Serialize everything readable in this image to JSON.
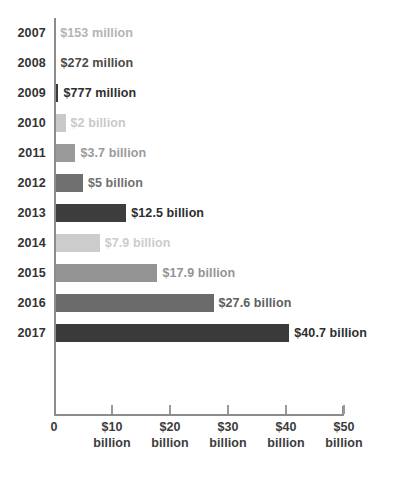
{
  "chart_data": {
    "type": "bar",
    "orientation": "horizontal",
    "title": "",
    "subtitle": "",
    "xlabel": "",
    "ylabel": "",
    "xlim": [
      0,
      50
    ],
    "grid": false,
    "legend": null,
    "categories": [
      "2007",
      "2008",
      "2009",
      "2010",
      "2011",
      "2012",
      "2013",
      "2014",
      "2015",
      "2016",
      "2017"
    ],
    "values": [
      0.153,
      0.272,
      0.777,
      2,
      3.7,
      5,
      12.5,
      7.9,
      17.9,
      27.6,
      40.7
    ],
    "unit": "USD billions",
    "data_labels": [
      "$153  million",
      "$272  million",
      "$777 million",
      "$2 billion",
      "$3.7 billion",
      "$5 billion",
      "$12.5 billion",
      "$7.9 billion",
      "$17.9 billion",
      "$27.6 billion",
      "$40.7 billion"
    ],
    "bar_colors": [
      "#b4b4b4",
      "#4a4a4a",
      "#3a3a3a",
      "#c9c9c9",
      "#9a9a9a",
      "#707070",
      "#3d3d3d",
      "#cccccc",
      "#949494",
      "#6b6b6b",
      "#3a3a3a"
    ],
    "label_colors": [
      "#b4b4b4",
      "#4a4a4a",
      "#2e2e2e",
      "#c9c9c9",
      "#9a9a9a",
      "#707070",
      "#2e2e2e",
      "#cccccc",
      "#949494",
      "#5e5e5e",
      "#2e2e2e"
    ],
    "xticks": [
      {
        "value": 0,
        "label": "0",
        "unit": ""
      },
      {
        "value": 10,
        "label": "$10",
        "unit": "billion"
      },
      {
        "value": 20,
        "label": "$20",
        "unit": "billion"
      },
      {
        "value": 30,
        "label": "$30",
        "unit": "billion"
      },
      {
        "value": 40,
        "label": "$40",
        "unit": "billion"
      },
      {
        "value": 50,
        "label": "$50",
        "unit": "billion"
      }
    ]
  },
  "layout": {
    "plot_left": 54,
    "plot_top": 18,
    "row_height": 30,
    "bar_height": 18,
    "px_per_billion": 5.78,
    "axis_color": "#8c8c8c"
  }
}
